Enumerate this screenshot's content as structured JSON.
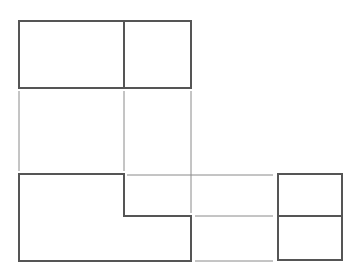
{
  "drawing": {
    "type": "orthographic-projection",
    "views": [
      {
        "name": "top-view",
        "outer": {
          "x": 19,
          "y": 21,
          "w": 172,
          "h": 67
        },
        "dividers": [
          {
            "x1": 124,
            "y1": 21,
            "x2": 124,
            "y2": 88
          }
        ]
      },
      {
        "name": "front-view",
        "points": "19,174 124,174 124,216 191,216 191,261 19,261"
      },
      {
        "name": "side-view",
        "outer": {
          "x": 278,
          "y": 174,
          "w": 64,
          "h": 86
        },
        "dividers": [
          {
            "x1": 278,
            "y1": 216,
            "x2": 342,
            "y2": 216
          }
        ]
      }
    ],
    "projection_lines": [
      {
        "x1": 19,
        "y1": 91,
        "x2": 19,
        "y2": 171
      },
      {
        "x1": 124,
        "y1": 91,
        "x2": 124,
        "y2": 171
      },
      {
        "x1": 191,
        "y1": 91,
        "x2": 191,
        "y2": 213
      },
      {
        "x1": 127,
        "y1": 175,
        "x2": 273,
        "y2": 175
      },
      {
        "x1": 195,
        "y1": 216,
        "x2": 273,
        "y2": 216
      },
      {
        "x1": 195,
        "y1": 261,
        "x2": 273,
        "y2": 261
      }
    ],
    "colors": {
      "outline": "#555555",
      "projection": "#8a8a8a",
      "background": "#ffffff"
    }
  }
}
